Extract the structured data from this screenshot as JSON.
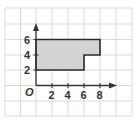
{
  "figure": {
    "type": "coordinate-grid-polygon",
    "origin_label": "O",
    "x_ticks": [
      "2",
      "4",
      "6",
      "8"
    ],
    "y_ticks": [
      "2",
      "4",
      "6"
    ],
    "grid_step_units": 2,
    "polygon_vertices": [
      [
        0,
        2
      ],
      [
        0,
        6
      ],
      [
        8,
        6
      ],
      [
        8,
        4
      ],
      [
        6,
        4
      ],
      [
        6,
        2
      ]
    ],
    "colors": {
      "grid": "#d9d9d9",
      "axis": "#333333",
      "fill": "#d3d3d3",
      "outline": "#2b2b2b"
    }
  }
}
